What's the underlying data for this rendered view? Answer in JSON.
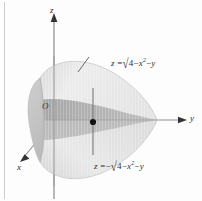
{
  "figure": {
    "background_color": "#fdfdfd",
    "border_color": "#c8c8c8",
    "axes": {
      "z_label": "z",
      "y_label": "y",
      "x_label": "x",
      "origin_label": "O",
      "axis_color": "#9a9a9a",
      "arrow_color": "#3a3a3a"
    },
    "labels": {
      "upper_equation": {
        "lhs": "z",
        "equals": "=",
        "sign": "",
        "radical": "√",
        "radicand_a": "4",
        "minus1": "−",
        "radicand_b": "x",
        "exponent": "2",
        "minus2": "−",
        "radicand_c": "y",
        "full_text": "z = √(4 − x² − y)"
      },
      "lower_equation": {
        "lhs": "z",
        "equals": "=",
        "sign": "−",
        "radical": "√",
        "radicand_a": "4",
        "minus1": "−",
        "radicand_b": "x",
        "exponent": "2",
        "minus2": "−",
        "radicand_c": "y",
        "full_text": "z = −√(4 − x² − y)"
      }
    },
    "surface": {
      "upper_fill": "#e9e9e9",
      "lower_fill": "#e2e2e2",
      "band_fill": "#b0b0b0",
      "band_fill_light": "#c4c4c4",
      "base_fill": "#d2d2d2",
      "outline_color": "#b6b6b6",
      "point_color": "#1a1a1a",
      "point_line_color": "#6b6b6b"
    }
  }
}
